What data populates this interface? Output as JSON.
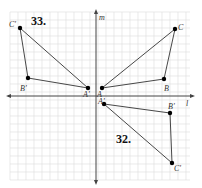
{
  "figure": {
    "exercises": [
      {
        "number": "33.",
        "original": {
          "A": [
            102,
            88
          ],
          "B": [
            164,
            79
          ],
          "C": [
            175,
            29
          ]
        },
        "image": {
          "A'": [
            88,
            88
          ],
          "B'": [
            28,
            78
          ],
          "C'": [
            20,
            28
          ]
        },
        "mirror_line": "m"
      },
      {
        "number": "32.",
        "original": {
          "A": [
            102,
            88
          ],
          "B": [
            164,
            79
          ],
          "C": [
            175,
            29
          ]
        },
        "image": {
          "A'": [
            104,
            104
          ],
          "B'": [
            170,
            113
          ],
          "C'": [
            172,
            163
          ]
        },
        "mirror_line": "l"
      }
    ],
    "axes": {
      "vertical_label": "m",
      "horizontal_label": "l"
    },
    "labels": {
      "ex33": "33.",
      "ex32": "32.",
      "C_prime_33": "C'",
      "B_prime_33": "B'",
      "A_prime_33": "A'",
      "A_33": "A",
      "B_33": "B",
      "C_33": "C",
      "A_prime_32": "A'",
      "B_prime_32": "B'",
      "C_prime_32": "C'",
      "m": "m",
      "l": "l"
    },
    "colors": {
      "grid": "#d8d8d8",
      "axis": "#444444",
      "triangle": "#333333",
      "point": "#000000"
    }
  }
}
